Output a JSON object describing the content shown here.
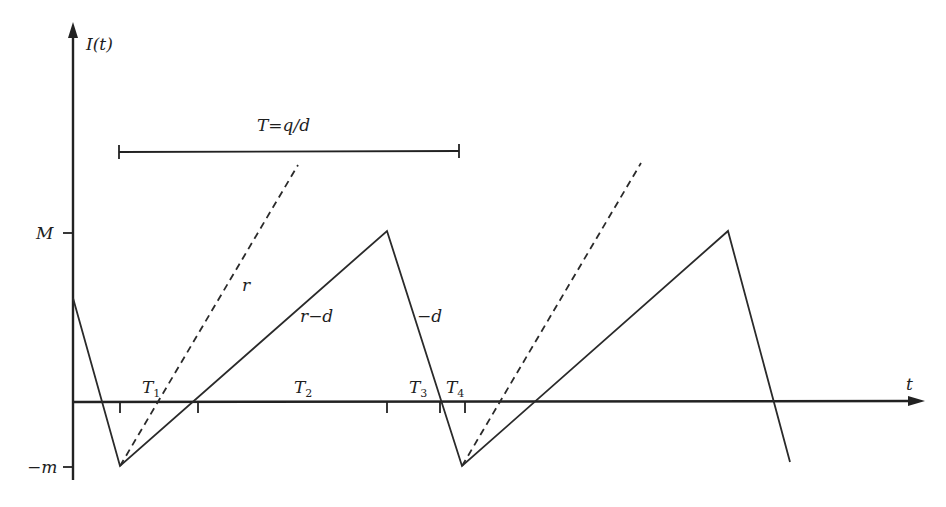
{
  "diagram": {
    "y_axis_label": "I(t)",
    "x_axis_label": "t",
    "y_ticks": [
      {
        "label": "M",
        "y": 233
      },
      {
        "label": "−m",
        "y": 467
      }
    ],
    "period_bracket": {
      "label": "T=q/d",
      "x1": 119,
      "x2": 459,
      "y": 151
    },
    "segment_labels": [
      {
        "id": "r",
        "text": "r",
        "x": 242,
        "y": 291
      },
      {
        "id": "r-minus-d",
        "text": "r−d",
        "x": 300,
        "y": 322
      },
      {
        "id": "minus-d",
        "text": "−d",
        "x": 417,
        "y": 322
      }
    ],
    "interval_labels": [
      {
        "id": "T1",
        "main": "T",
        "sub": "1",
        "x": 142,
        "y": 393
      },
      {
        "id": "T2",
        "main": "T",
        "sub": "2",
        "x": 294,
        "y": 393
      },
      {
        "id": "T3",
        "main": "T",
        "sub": "3",
        "x": 409,
        "y": 393
      },
      {
        "id": "T4",
        "main": "T",
        "sub": "4",
        "x": 446,
        "y": 393
      }
    ],
    "axis_ticks_x": [
      120,
      198,
      387,
      440,
      465
    ],
    "solid_path": [
      [
        73,
        298
      ],
      [
        120,
        466
      ],
      [
        387,
        231
      ],
      [
        462,
        466
      ],
      [
        728,
        231
      ],
      [
        790,
        462
      ]
    ],
    "dashed_lines": [
      [
        [
          120,
          466
        ],
        [
          298,
          165
        ]
      ],
      [
        [
          462,
          466
        ],
        [
          641,
          163
        ]
      ]
    ],
    "colors": {
      "line": "#2a2a2a",
      "background": "#ffffff"
    }
  }
}
